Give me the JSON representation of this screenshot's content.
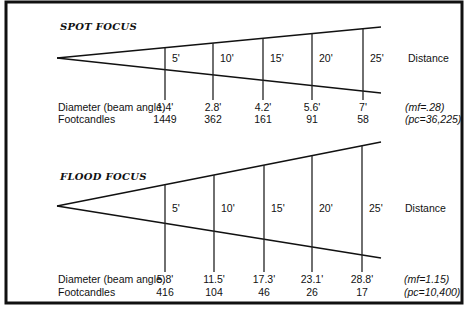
{
  "chart_data": {
    "type": "diagram",
    "distance_label": "Distance",
    "distance_units": "feet",
    "distances": [
      "5'",
      "10'",
      "15'",
      "20'",
      "25'"
    ],
    "panels": [
      {
        "id": "spot",
        "title": "SPOT FOCUS",
        "row_labels": {
          "diameter": "Diameter (beam angle)",
          "footcandles": "Footcandles"
        },
        "diameter": [
          "1.4'",
          "2.8'",
          "4.2'",
          "5.6'",
          "7'"
        ],
        "diameter_values": [
          1.4,
          2.8,
          4.2,
          5.6,
          7
        ],
        "footcandles": [
          "1449",
          "362",
          "161",
          "91",
          "58"
        ],
        "footcandle_values": [
          1449,
          362,
          161,
          91,
          58
        ],
        "notes": {
          "mf": "(mf=.28)",
          "pc": "(pc=36,225)"
        },
        "geometry": {
          "apex": [
            57,
            58
          ],
          "top_end": [
            381,
            27
          ],
          "bottom_end": [
            381,
            93
          ],
          "tick_x": [
            165,
            213,
            263,
            312,
            363
          ],
          "tick_bottom": 100,
          "title_y": 30,
          "label_y": 58,
          "diam_y": 111,
          "fc_y": 123
        }
      },
      {
        "id": "flood",
        "title": "FLOOD FOCUS",
        "row_labels": {
          "diameter": "Diameter (beam angle)",
          "footcandles": "Footcandles"
        },
        "diameter": [
          "5.8'",
          "11.5'",
          "17.3'",
          "23.1'",
          "28.8'"
        ],
        "diameter_values": [
          5.8,
          11.5,
          17.3,
          23.1,
          28.8
        ],
        "footcandles": [
          "416",
          "104",
          "46",
          "26",
          "17"
        ],
        "footcandle_values": [
          416,
          104,
          46,
          26,
          17
        ],
        "notes": {
          "mf": "(mf=1.15)",
          "pc": "(pc=10,400)"
        },
        "geometry": {
          "apex": [
            57,
            206
          ],
          "top_end": [
            381,
            142
          ],
          "bottom_end": [
            381,
            258
          ],
          "tick_x": [
            165,
            214,
            264,
            312,
            362
          ],
          "tick_bottom": 272,
          "title_y": 180,
          "label_y": 208,
          "diam_y": 283,
          "fc_y": 296
        }
      }
    ]
  },
  "frame": {
    "x": 6,
    "y": 2,
    "width": 456,
    "height": 301
  }
}
